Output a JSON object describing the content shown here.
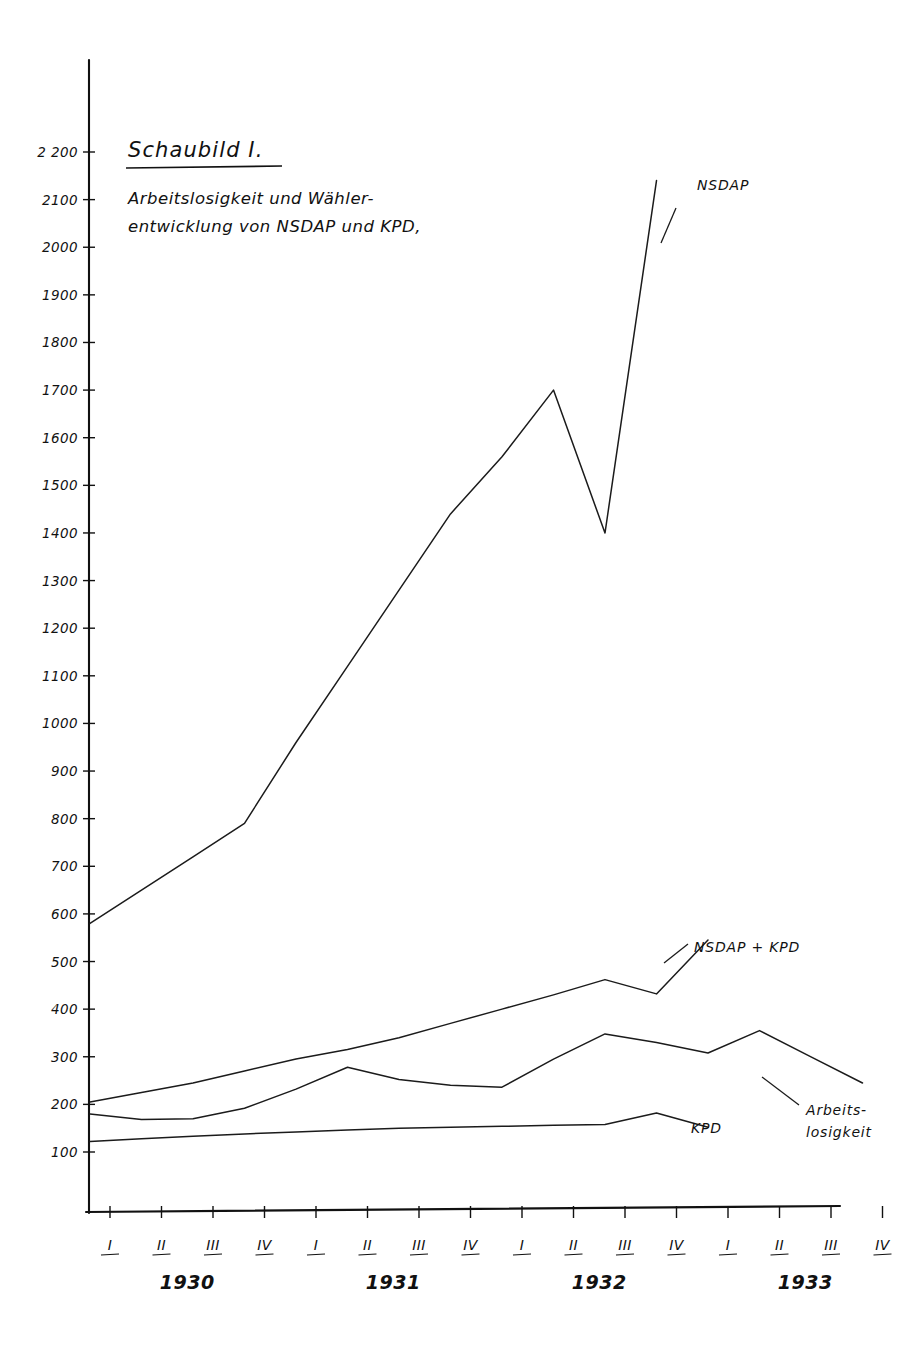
{
  "figure": {
    "title": "Schaubild I.",
    "subtitle_line1": "Arbeitslosigkeit und Wähler-",
    "subtitle_line2": "entwicklung von NSDAP und KPD,"
  },
  "chart_data": {
    "type": "line",
    "xlabel": "",
    "ylabel": "",
    "ylim": [
      0,
      2300
    ],
    "grid": false,
    "legend_position": "inline-right",
    "y_ticks": [
      100,
      200,
      300,
      400,
      500,
      600,
      700,
      800,
      900,
      1000,
      1100,
      1200,
      1300,
      1400,
      1500,
      1600,
      1700,
      1800,
      1900,
      2000,
      2100,
      "2 200"
    ],
    "x_quarter_labels": [
      "I",
      "II",
      "III",
      "IV",
      "I",
      "II",
      "III",
      "IV",
      "I",
      "II",
      "III",
      "IV",
      "I",
      "II",
      "III",
      "IV"
    ],
    "x_year_labels": [
      "1930",
      "1931",
      "1932",
      "1933"
    ],
    "x": [
      "1930-I",
      "1930-II",
      "1930-III",
      "1930-IV",
      "1931-I",
      "1931-II",
      "1931-III",
      "1931-IV",
      "1932-I",
      "1932-II",
      "1932-III",
      "1932-IV",
      "1933-I",
      "1933-II",
      "1933-III",
      "1933-IV"
    ],
    "series": [
      {
        "name": "NSDAP",
        "label": "NSDAP",
        "values": [
          580,
          650,
          720,
          790,
          960,
          1120,
          1280,
          1440,
          1560,
          1700,
          1400,
          2140,
          null,
          null,
          null,
          null
        ]
      },
      {
        "name": "NSDAP + KPD",
        "label": "NSDAP + KPD",
        "values": [
          205,
          225,
          245,
          270,
          295,
          315,
          340,
          370,
          400,
          430,
          462,
          432,
          545,
          null,
          null,
          null
        ]
      },
      {
        "name": "Arbeitslosigkeit",
        "label_line1": "Arbeits-",
        "label_line2": "losigkeit",
        "values": [
          180,
          168,
          170,
          192,
          232,
          278,
          252,
          240,
          236,
          295,
          348,
          330,
          308,
          355,
          300,
          245
        ]
      },
      {
        "name": "KPD",
        "label": "KPD",
        "values": [
          122,
          128,
          133,
          138,
          142,
          146,
          150,
          152,
          154,
          156,
          158,
          182,
          152,
          null,
          null,
          null
        ]
      }
    ]
  },
  "annotations": {
    "nsdap": "NSDAP",
    "nsdap_kpd": "NSDAP + KPD",
    "kpd": "KPD",
    "arbeitslosigkeit_line1": "Arbeits-",
    "arbeitslosigkeit_line2": "losigkeit"
  },
  "style": {
    "ink": "#1b1b1b",
    "paper": "#ffffff"
  }
}
